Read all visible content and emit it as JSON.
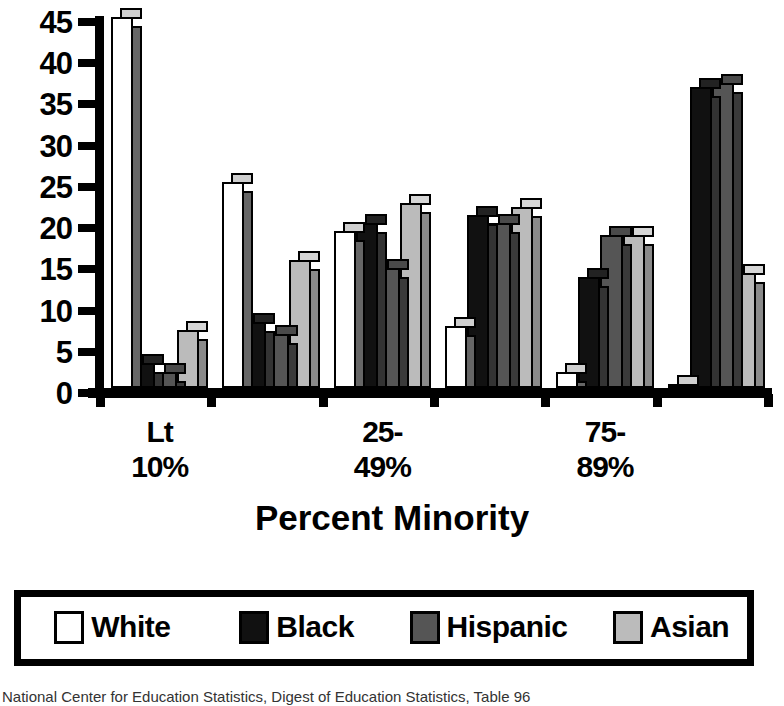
{
  "chart_data": {
    "type": "bar",
    "title": "",
    "xlabel": "Percent Minority",
    "ylabel": "",
    "ylim": [
      0,
      45
    ],
    "yticks": [
      0,
      5,
      10,
      15,
      20,
      25,
      30,
      35,
      40,
      45
    ],
    "grid": false,
    "legend_position": "bottom",
    "categories": [
      "Lt\n10%",
      "10-\n24%",
      "25-\n49%",
      "50-\n74%",
      "75-\n89%",
      "90%\nor more"
    ],
    "category_labels_shown": [
      "Lt\n10%",
      "",
      "25-\n49%",
      "",
      "75-\n89%",
      ""
    ],
    "series": [
      {
        "name": "White",
        "color": "#ffffff",
        "values": [
          45,
          25,
          19,
          7.5,
          2,
          0.5
        ]
      },
      {
        "name": "Black",
        "color": "#111111",
        "values": [
          3,
          8,
          20,
          21,
          13.5,
          36.5
        ]
      },
      {
        "name": "Hispanic",
        "color": "#555555",
        "values": [
          2,
          6.5,
          14.5,
          20,
          18.5,
          37
        ]
      },
      {
        "name": "Asian",
        "color": "#bbbbbb",
        "values": [
          7,
          15.5,
          22.5,
          22,
          18.5,
          14
        ]
      }
    ]
  },
  "axis": {
    "x_title": "Percent Minority",
    "y_tick_labels": [
      "45",
      "40",
      "35",
      "30",
      "25",
      "20",
      "15",
      "10",
      "5",
      "0"
    ]
  },
  "legend": {
    "items": [
      {
        "label": "White",
        "color": "#ffffff"
      },
      {
        "label": "Black",
        "color": "#111111"
      },
      {
        "label": "Hispanic",
        "color": "#555555"
      },
      {
        "label": "Asian",
        "color": "#bbbbbb"
      }
    ]
  },
  "source": {
    "text": "National Center for Education Statistics, Digest of Education Statistics, Table 96"
  }
}
